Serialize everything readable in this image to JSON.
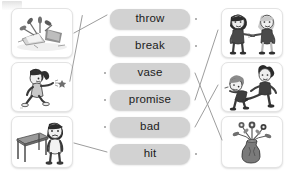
{
  "worksheet": {
    "type": "matching-exercise",
    "instruction_visible": false,
    "palette": {
      "page_background": "#ffffff",
      "button_fill": "#d2d2d2",
      "button_text": "#1b1b1b",
      "card_border": "#e3e3e3",
      "connector_line": "#9d9d9d",
      "connector_dot": "#9a9a9a"
    }
  },
  "words": [
    {
      "label": "throw",
      "name": "word-throw"
    },
    {
      "label": "break",
      "name": "word-break"
    },
    {
      "label": "vase",
      "name": "word-vase"
    },
    {
      "label": "promise",
      "name": "word-promise"
    },
    {
      "label": "bad",
      "name": "word-bad"
    },
    {
      "label": "hit",
      "name": "word-hit"
    }
  ],
  "left_pictures": [
    {
      "alt": "broken vase with shards and flowers on the floor",
      "icon": "broken-vase-icon"
    },
    {
      "alt": "girl throwing an object",
      "icon": "girl-throwing-icon"
    },
    {
      "alt": "sad boy standing beside a table",
      "icon": "sad-boy-table-icon"
    }
  ],
  "right_pictures": [
    {
      "alt": "two children making a promise",
      "icon": "two-children-promise-icon"
    },
    {
      "alt": "one boy kicking another boy",
      "icon": "boy-hitting-boy-icon"
    },
    {
      "alt": "vase holding flowers",
      "icon": "flower-vase-icon"
    }
  ],
  "connections": [
    {
      "from": "left-picture-1",
      "to": "word-break",
      "name": "link-broken-vase-to-break"
    },
    {
      "from": "left-picture-2",
      "to": "word-throw",
      "name": "link-girl-throwing-to-throw"
    },
    {
      "from": "left-picture-3",
      "to": "word-hit",
      "name": "link-sad-boy-to-hit"
    },
    {
      "from": "word-vase",
      "to": "right-picture-3",
      "name": "link-vase-to-flower-vase"
    },
    {
      "from": "word-promise",
      "to": "right-picture-1",
      "name": "link-promise-to-two-children"
    },
    {
      "from": "word-bad",
      "to": "right-picture-2",
      "name": "link-bad-to-boy-hitting"
    }
  ]
}
